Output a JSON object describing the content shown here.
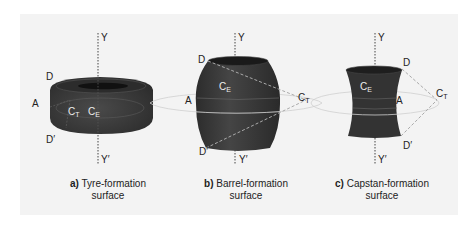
{
  "figure": {
    "panels": [
      {
        "id": "a",
        "letter": "a)",
        "caption_line1": "Tyre-formation",
        "caption_line2": "surface",
        "labels": {
          "Y": "Y",
          "Y_prime": "Y′",
          "D": "D",
          "D_prime": "D′",
          "A": "A",
          "C_T": "C",
          "C_T_sub": "T",
          "C_E": "C",
          "C_E_sub": "E"
        }
      },
      {
        "id": "b",
        "letter": "b)",
        "caption_line1": "Barrel-formation",
        "caption_line2": "surface",
        "labels": {
          "Y": "Y",
          "Y_prime": "Y′",
          "D": "D",
          "D_prime": "D′",
          "A": "A",
          "C_T": "C",
          "C_T_sub": "T",
          "C_E": "C",
          "C_E_sub": "E"
        }
      },
      {
        "id": "c",
        "letter": "c)",
        "caption_line1": "Capstan-formation",
        "caption_line2": "surface",
        "labels": {
          "Y": "Y",
          "Y_prime": "Y′",
          "D": "D",
          "D_prime": "D′",
          "A": "A",
          "C_T": "C",
          "C_T_sub": "T",
          "C_E": "C",
          "C_E_sub": "E"
        }
      }
    ],
    "colors": {
      "panel_bg": "#f3f3f3",
      "solid_fill": "#3a3a3a",
      "solid_dark": "#222222",
      "ring_stroke": "#c8c8c8",
      "dashed_stroke": "#b0b0b0"
    }
  }
}
